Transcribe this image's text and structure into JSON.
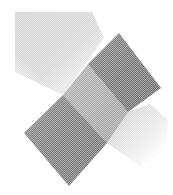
{
  "graphic": {
    "description": "Abstract halftone logo of overlapping diagonal squares",
    "colors": {
      "background": "#ffffff",
      "dark_square": "#7a7a7a",
      "mid_square": "#a9a9a9",
      "light_square": "#d6d6d6",
      "fade_region": "#e2e2e2"
    },
    "shapes": {
      "upper_light_square": [
        [
          15,
          12
        ],
        [
          90,
          12
        ],
        [
          100,
          40
        ],
        [
          63,
          95
        ],
        [
          15,
          70
        ]
      ],
      "upper_dark_square": [
        [
          119,
          33
        ],
        [
          161,
          88
        ],
        [
          128,
          112
        ],
        [
          88,
          64
        ]
      ],
      "middle_square": [
        [
          88,
          64
        ],
        [
          128,
          112
        ],
        [
          107,
          143
        ],
        [
          63,
          95
        ]
      ],
      "lower_dark_square": [
        [
          63,
          95
        ],
        [
          107,
          143
        ],
        [
          69,
          186
        ],
        [
          24,
          133
        ]
      ],
      "lower_right_fade": [
        [
          128,
          112
        ],
        [
          165,
          100
        ],
        [
          168,
          150
        ],
        [
          140,
          165
        ],
        [
          107,
          143
        ]
      ]
    }
  }
}
